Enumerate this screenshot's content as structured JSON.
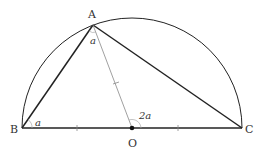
{
  "diagram": {
    "title": "",
    "points": {
      "A": {
        "label": "A",
        "x": 93,
        "y": 25
      },
      "B": {
        "label": "B",
        "x": 22,
        "y": 128
      },
      "C": {
        "label": "C",
        "x": 242,
        "y": 128
      },
      "O": {
        "label": "O",
        "x": 132,
        "y": 128
      }
    },
    "angles": {
      "at_A": "a",
      "at_B": "a",
      "at_O": "2a"
    },
    "colors": {
      "stroke": "#222222",
      "thin": "#888888",
      "label": "#333333"
    },
    "elements": [
      "semicircle centered O with diameter BC",
      "triangle ABC",
      "segment AO",
      "equal tick marks on BO, OC, AO"
    ]
  }
}
